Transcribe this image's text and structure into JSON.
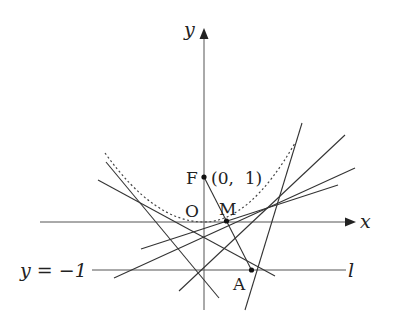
{
  "figure": {
    "labels": {
      "y_axis": "y",
      "x_axis": "x",
      "origin": "O",
      "focus": "F",
      "focus_coords": "(0,  1)",
      "midpoint": "M",
      "point_on_directrix": "A",
      "directrix_equation": "y = −1",
      "directrix_name": "l"
    },
    "colors": {
      "line": "#333333",
      "axis": "#555555",
      "background": "#ffffff"
    },
    "parabola": {
      "equation": "x^2 = 4y",
      "style": "dashed"
    },
    "points": [
      {
        "name": "F",
        "x": 0,
        "y": 1
      },
      {
        "name": "O",
        "x": 0,
        "y": 0
      },
      {
        "name": "M",
        "on": "segment FA"
      },
      {
        "name": "A",
        "on": "line l"
      }
    ]
  }
}
